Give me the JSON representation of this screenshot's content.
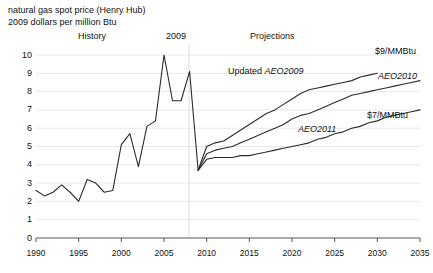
{
  "header": {
    "line1": "natural gas spot price (Henry Hub)",
    "line2": "2009 dollars per million Btu"
  },
  "annotations": {
    "history": "History",
    "divider_year": "2009",
    "projections": "Projections",
    "updated_aeo2009_prefix": "Updated ",
    "updated_aeo2009_name": "AEO2009",
    "aeo2010": "AEO2010",
    "aeo2011": "AEO2011",
    "endpoint_high": "$9/MMBtu",
    "endpoint_low": "$7/MMBtu"
  },
  "colors": {
    "line": "#2b2b2b",
    "grid": "#e8e8e8",
    "axis": "#555555",
    "text": "#111111",
    "divider": "#dcdcdc"
  },
  "chart_data": {
    "type": "line",
    "title": "natural gas spot price (Henry Hub)",
    "subtitle": "2009 dollars per million Btu",
    "xlabel": "",
    "ylabel": "2009 dollars per million Btu",
    "xlim": [
      1990,
      2035
    ],
    "ylim": [
      0,
      10
    ],
    "xticks": [
      1990,
      1995,
      2000,
      2005,
      2010,
      2015,
      2020,
      2025,
      2030,
      2035
    ],
    "yticks": [
      0,
      1,
      2,
      3,
      4,
      5,
      6,
      7,
      8,
      9,
      10
    ],
    "grid": "horizontal",
    "legend": "inline-annotations",
    "divider_x": 2009,
    "series": [
      {
        "name": "History",
        "x": [
          1990,
          1991,
          1992,
          1993,
          1994,
          1995,
          1996,
          1997,
          1998,
          1999,
          2000,
          2001,
          2002,
          2003,
          2004,
          2005,
          2006,
          2007,
          2008,
          2009
        ],
        "values": [
          2.6,
          2.3,
          2.5,
          2.9,
          2.5,
          2.0,
          3.2,
          3.0,
          2.5,
          2.6,
          5.1,
          5.7,
          3.9,
          6.1,
          6.4,
          10.0,
          7.5,
          7.5,
          9.1,
          3.7
        ]
      },
      {
        "name": "Updated AEO2009",
        "x": [
          2009,
          2010,
          2011,
          2012,
          2013,
          2014,
          2015,
          2016,
          2017,
          2018,
          2019,
          2020,
          2021,
          2022,
          2023,
          2024,
          2025,
          2026,
          2027,
          2028,
          2029,
          2030
        ],
        "values": [
          3.7,
          5.0,
          5.2,
          5.3,
          5.6,
          5.9,
          6.2,
          6.5,
          6.8,
          7.0,
          7.3,
          7.6,
          7.9,
          8.1,
          8.2,
          8.3,
          8.4,
          8.5,
          8.6,
          8.8,
          8.9,
          9.0
        ]
      },
      {
        "name": "AEO2010",
        "x": [
          2009,
          2010,
          2011,
          2012,
          2013,
          2014,
          2015,
          2016,
          2017,
          2018,
          2019,
          2020,
          2021,
          2022,
          2023,
          2024,
          2025,
          2026,
          2027,
          2028,
          2029,
          2030,
          2031,
          2032,
          2033,
          2034,
          2035
        ],
        "values": [
          3.7,
          4.6,
          4.8,
          4.9,
          5.0,
          5.2,
          5.4,
          5.6,
          5.8,
          6.0,
          6.2,
          6.5,
          6.7,
          6.8,
          7.0,
          7.2,
          7.4,
          7.6,
          7.8,
          7.9,
          8.0,
          8.1,
          8.2,
          8.3,
          8.4,
          8.5,
          8.6
        ]
      },
      {
        "name": "AEO2011",
        "x": [
          2009,
          2010,
          2011,
          2012,
          2013,
          2014,
          2015,
          2016,
          2017,
          2018,
          2019,
          2020,
          2021,
          2022,
          2023,
          2024,
          2025,
          2026,
          2027,
          2028,
          2029,
          2030,
          2031,
          2032,
          2033,
          2034,
          2035
        ],
        "values": [
          3.7,
          4.3,
          4.4,
          4.4,
          4.4,
          4.5,
          4.5,
          4.6,
          4.7,
          4.8,
          4.9,
          5.0,
          5.1,
          5.2,
          5.4,
          5.5,
          5.7,
          5.8,
          6.0,
          6.1,
          6.3,
          6.4,
          6.6,
          6.7,
          6.8,
          6.9,
          7.0
        ]
      }
    ],
    "endpoint_labels": [
      {
        "text": "$9/MMBtu",
        "series": "Updated AEO2009"
      },
      {
        "text": "$7/MMBtu",
        "series": "AEO2011"
      }
    ]
  }
}
